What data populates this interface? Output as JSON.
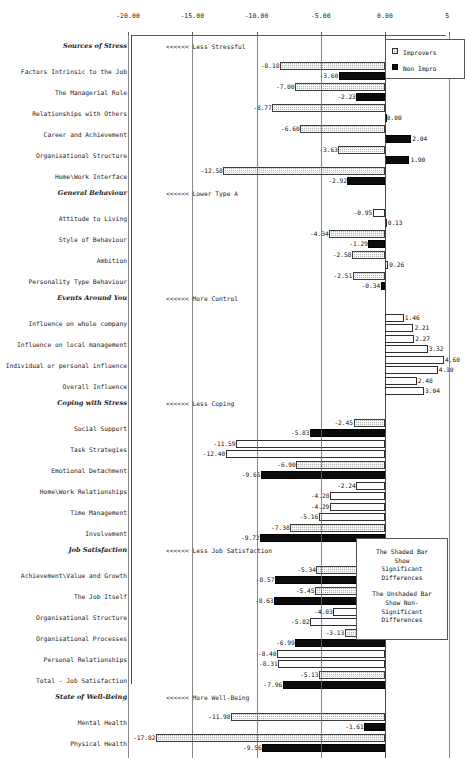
{
  "chart_data": {
    "type": "bar",
    "title": "",
    "xlabel": "",
    "ylabel": "",
    "orientation": "horizontal",
    "xlim": [
      -20.9,
      5.5
    ],
    "grid": true,
    "axis_ticks": [
      "-20.00",
      "-15.00",
      "-10.00",
      "-5.00",
      "0.00",
      "5"
    ],
    "axis_tick_values": [
      -20,
      -15,
      -10,
      -5,
      0,
      5
    ],
    "legend": {
      "position": "top-right",
      "entries": [
        {
          "label": "Improvers",
          "key": "improvers",
          "style": "shaded"
        },
        {
          "label": "Non Impro",
          "key": "non_improvers",
          "style": "black"
        }
      ]
    },
    "note": {
      "lines_shaded": [
        "The Shaded Bar",
        "Show",
        "Significant",
        "Differences"
      ],
      "lines_unshaded": [
        "The Unshaded Bar",
        "Show Non-",
        "Significant",
        "Differences"
      ]
    },
    "groups": [
      {
        "name": "Sources of Stress",
        "annotation": "<<<<<< Less Stressful",
        "rows": [
          {
            "label": "Factors Intrinsic to the Job",
            "improvers": -8.18,
            "non_improvers": -3.6,
            "improvers_sig": true,
            "non_improvers_sig": true
          },
          {
            "label": "The Managerial Role",
            "improvers": -7.0,
            "non_improvers": -2.23,
            "improvers_sig": true,
            "non_improvers_sig": true
          },
          {
            "label": "Relationships with Others",
            "improvers": -8.77,
            "non_improvers": 0.0,
            "improvers_sig": true,
            "non_improvers_sig": true
          },
          {
            "label": "Career and Achievement",
            "improvers": -6.6,
            "non_improvers": 2.04,
            "improvers_sig": true,
            "non_improvers_sig": true
          },
          {
            "label": "Organisational Structure",
            "improvers": -3.63,
            "non_improvers": 1.9,
            "improvers_sig": true,
            "non_improvers_sig": true
          },
          {
            "label": "Home\\Work Interface",
            "improvers": -12.58,
            "non_improvers": -2.92,
            "improvers_sig": true,
            "non_improvers_sig": true
          }
        ]
      },
      {
        "name": "General Behaviour",
        "annotation": "<<<<<< Lower Type A",
        "rows": [
          {
            "label": "Attitude to Living",
            "improvers": -0.95,
            "non_improvers": 0.13,
            "improvers_sig": false,
            "non_improvers_sig": false
          },
          {
            "label": "Style of Behaviour",
            "improvers": -4.34,
            "non_improvers": -1.29,
            "improvers_sig": true,
            "non_improvers_sig": true
          },
          {
            "label": "Ambition",
            "improvers": -2.58,
            "non_improvers": 0.26,
            "improvers_sig": true,
            "non_improvers_sig": false
          },
          {
            "label": "Personality Type Behaviour",
            "improvers": -2.51,
            "non_improvers": -0.34,
            "improvers_sig": true,
            "non_improvers_sig": true
          }
        ]
      },
      {
        "name": "Events Around You",
        "annotation": "<<<<<< More Control",
        "rows": [
          {
            "label": "Influence on whole company",
            "improvers": 1.46,
            "non_improvers": 2.21,
            "improvers_sig": false,
            "non_improvers_sig": false
          },
          {
            "label": "Influence on local management",
            "improvers": 2.27,
            "non_improvers": 3.32,
            "improvers_sig": false,
            "non_improvers_sig": false
          },
          {
            "label": "Individual or personal influence",
            "improvers": 4.6,
            "non_improvers": 4.1,
            "improvers_sig": false,
            "non_improvers_sig": false
          },
          {
            "label": "Overall Influence",
            "improvers": 2.48,
            "non_improvers": 3.04,
            "improvers_sig": false,
            "non_improvers_sig": false
          }
        ]
      },
      {
        "name": "Coping with Stress",
        "annotation": "<<<<<< Less Coping",
        "rows": [
          {
            "label": "Social Support",
            "improvers": -2.45,
            "non_improvers": -5.83,
            "improvers_sig": true,
            "non_improvers_sig": true
          },
          {
            "label": "Task Strategies",
            "improvers": -11.59,
            "non_improvers": -12.4,
            "improvers_sig": false,
            "non_improvers_sig": false
          },
          {
            "label": "Emotional Detachment",
            "improvers": -6.9,
            "non_improvers": -9.65,
            "improvers_sig": true,
            "non_improvers_sig": true
          },
          {
            "label": "Home\\Work Relationships",
            "improvers": -2.24,
            "non_improvers": -4.28,
            "improvers_sig": false,
            "non_improvers_sig": false
          },
          {
            "label": "Time Management",
            "improvers": -4.29,
            "non_improvers": -5.16,
            "improvers_sig": false,
            "non_improvers_sig": false
          },
          {
            "label": "Involvement",
            "improvers": -7.38,
            "non_improvers": -9.72,
            "improvers_sig": true,
            "non_improvers_sig": true
          }
        ]
      },
      {
        "name": "Job Satisfaction",
        "annotation": "<<<<<< Less Job Satisfaction",
        "rows": [
          {
            "label": "Achievement\\Value and Growth",
            "improvers": -5.34,
            "non_improvers": -8.57,
            "improvers_sig": true,
            "non_improvers_sig": true
          },
          {
            "label": "The Job Itself",
            "improvers": -5.45,
            "non_improvers": -8.63,
            "improvers_sig": true,
            "non_improvers_sig": true
          },
          {
            "label": "Organisational Structure",
            "improvers": -4.03,
            "non_improvers": -5.82,
            "improvers_sig": false,
            "non_improvers_sig": false
          },
          {
            "label": "Organisational Processes",
            "improvers": -3.13,
            "non_improvers": -6.99,
            "improvers_sig": true,
            "non_improvers_sig": true
          },
          {
            "label": "Personal Relationships",
            "improvers": -8.4,
            "non_improvers": -8.31,
            "improvers_sig": false,
            "non_improvers_sig": false
          },
          {
            "label": "Total - Job Satisfaction",
            "improvers": -5.13,
            "non_improvers": -7.96,
            "improvers_sig": true,
            "non_improvers_sig": true
          }
        ]
      },
      {
        "name": "State of Well-Being",
        "annotation": "<<<<<< More Well-Being",
        "rows": [
          {
            "label": "Mental Health",
            "improvers": -11.98,
            "non_improvers": -1.61,
            "improvers_sig": true,
            "non_improvers_sig": true
          },
          {
            "label": "Physical Health",
            "improvers": -17.82,
            "non_improvers": -9.56,
            "improvers_sig": true,
            "non_improvers_sig": true
          }
        ]
      }
    ]
  }
}
